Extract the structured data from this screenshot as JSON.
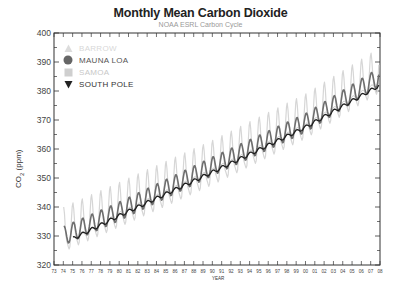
{
  "chart_data": {
    "type": "line",
    "title": "Monthly Mean Carbon Dioxide",
    "subtitle": "NOAA ESRL Carbon Cycle",
    "xlabel": "YEAR",
    "ylabel": "CO2 (ppm)",
    "ylim": [
      320,
      400
    ],
    "xlim": [
      1973,
      2008
    ],
    "yticks": [
      320,
      330,
      340,
      350,
      360,
      370,
      380,
      390,
      400
    ],
    "xtick_labels": [
      "73",
      "74",
      "75",
      "76",
      "77",
      "78",
      "79",
      "80",
      "81",
      "82",
      "83",
      "84",
      "85",
      "86",
      "87",
      "88",
      "89",
      "90",
      "91",
      "92",
      "93",
      "94",
      "95",
      "96",
      "97",
      "98",
      "99",
      "00",
      "01",
      "02",
      "03",
      "04",
      "05",
      "06",
      "07",
      "08"
    ],
    "grid": false,
    "legend_position": "upper-left",
    "series": [
      {
        "name": "BARROW",
        "marker": "triangle-up",
        "color": "#d6d6d6",
        "start_year": 1974,
        "trend": {
          "1974": 331,
          "1980": 339.5,
          "1990": 354,
          "2000": 370,
          "2008": 386
        },
        "seasonal_amplitude": 16
      },
      {
        "name": "MAUNA LOA",
        "marker": "circle",
        "color": "#6e6e6e",
        "start_year": 1974,
        "trend": {
          "1974": 330,
          "1980": 338.5,
          "1990": 354,
          "2000": 369,
          "2008": 385
        },
        "seasonal_amplitude": 6.5
      },
      {
        "name": "SAMOA",
        "marker": "square",
        "color": "#c8c8c8",
        "start_year": 1976,
        "trend": {
          "1976": 330,
          "1980": 337.5,
          "1990": 352.5,
          "2000": 368,
          "2008": 383
        },
        "seasonal_amplitude": 1.5
      },
      {
        "name": "SOUTH POLE",
        "marker": "triangle-down",
        "color": "#1e1e1e",
        "start_year": 1975,
        "trend": {
          "1975": 329,
          "1980": 337,
          "1990": 352,
          "2000": 367.5,
          "2008": 382
        },
        "seasonal_amplitude": 1.2
      }
    ]
  }
}
